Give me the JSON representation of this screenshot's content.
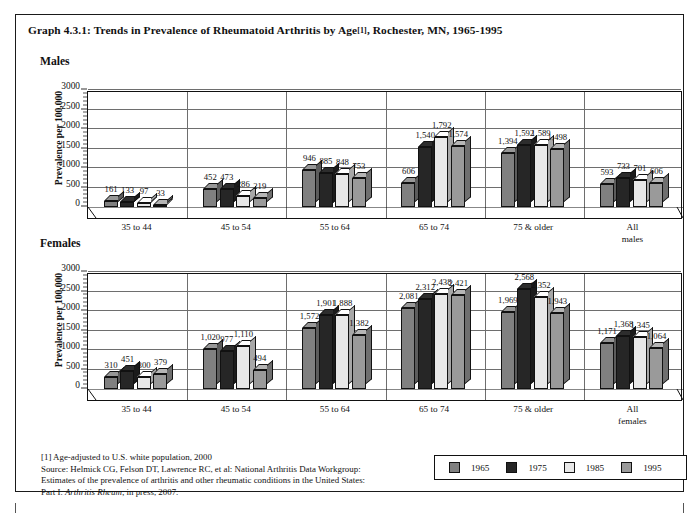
{
  "title": {
    "text_before": "Graph 4.3.1: Trends in Prevalence of Rheumatoid Arthritis by Age",
    "footnote_marker": "[1]",
    "text_after": ", Rochester, MN, 1965-1995"
  },
  "panels": {
    "males_label": "Males",
    "females_label": "Females"
  },
  "axis": {
    "ylabel": "Prevalence per 100,000",
    "yticks": [
      "0",
      "500",
      "1000",
      "1500",
      "2000",
      "2500",
      "3000"
    ]
  },
  "legend": {
    "items": [
      {
        "label": "1965",
        "color": "#808080"
      },
      {
        "label": "1975",
        "color": "#262626"
      },
      {
        "label": "1985",
        "color": "#e8e8e8"
      },
      {
        "label": "1995",
        "color": "#9a9a9a"
      }
    ]
  },
  "footnote": {
    "line1": "[1] Age-adjusted to U.S. white population, 2000",
    "line2": "Source: Helmick CG, Felson DT, Lawrence RC, et al: National Arthritis Data Workgroup:",
    "line3": "Estimates of the prevalence of arthritis and other rheumatic conditions in the United States:",
    "line4_a": "Part I. ",
    "line4_italic": "Arthritis Rheum",
    "line4_b": "; in press, 2007."
  },
  "chart_data": [
    {
      "type": "bar",
      "title": "Males",
      "xlabel": "",
      "ylabel": "Prevalence per 100,000",
      "ylim": [
        0,
        3000
      ],
      "ytick_step": 500,
      "grid": true,
      "legend_position": "bottom-right",
      "categories": [
        "35 to 44",
        "45 to 54",
        "55 to 64",
        "65 to 74",
        "75 & older",
        "All\nmales"
      ],
      "series": [
        {
          "name": "1965",
          "color": "#808080",
          "values": [
            161,
            452,
            946,
            606,
            1394,
            593
          ],
          "labels": [
            "161",
            "452",
            "946",
            "606",
            "1,394",
            "593"
          ]
        },
        {
          "name": "1975",
          "color": "#262626",
          "values": [
            133,
            473,
            885,
            1540,
            1592,
            733
          ],
          "labels": [
            "133",
            "473",
            "885",
            "1,540",
            "1,592",
            "733"
          ]
        },
        {
          "name": "1985",
          "color": "#e8e8e8",
          "values": [
            97,
            286,
            848,
            1792,
            1589,
            701
          ],
          "labels": [
            "97",
            "286",
            "848",
            "1,792",
            "1,589",
            "701"
          ]
        },
        {
          "name": "1995",
          "color": "#9a9a9a",
          "values": [
            33,
            219,
            753,
            1574,
            1498,
            606
          ],
          "labels": [
            "33",
            "219",
            "753",
            "1,574",
            "1,498",
            "606"
          ]
        }
      ]
    },
    {
      "type": "bar",
      "title": "Females",
      "xlabel": "",
      "ylabel": "Prevalence per 100,000",
      "ylim": [
        0,
        3000
      ],
      "ytick_step": 500,
      "grid": true,
      "legend_position": "bottom-right",
      "categories": [
        "35 to 44",
        "45 to 54",
        "55 to 64",
        "65 to 74",
        "75 & older",
        "All\nfemales"
      ],
      "series": [
        {
          "name": "1965",
          "color": "#808080",
          "values": [
            310,
            1020,
            1572,
            2081,
            1969,
            1171
          ],
          "labels": [
            "310",
            "1,020",
            "1,572",
            "2,081",
            "1,969",
            "1,171"
          ]
        },
        {
          "name": "1975",
          "color": "#262626",
          "values": [
            451,
            977,
            1901,
            2312,
            2568,
            1368
          ],
          "labels": [
            "451",
            "977",
            "1,901",
            "2,312",
            "2,568",
            "1,368"
          ]
        },
        {
          "name": "1985",
          "color": "#e8e8e8",
          "values": [
            300,
            1110,
            1888,
            2438,
            2352,
            1345
          ],
          "labels": [
            "300",
            "1,110",
            "1,888",
            "2,438",
            "2,352",
            "1,345"
          ]
        },
        {
          "name": "1995",
          "color": "#9a9a9a",
          "values": [
            379,
            494,
            1382,
            2421,
            1943,
            1064
          ],
          "labels": [
            "379",
            "494",
            "1,382",
            "2,421",
            "1,943",
            "1,064"
          ]
        }
      ]
    }
  ],
  "male_category_labels": [
    {
      "l1": "35 to 44",
      "l2": ""
    },
    {
      "l1": "45 to 54",
      "l2": ""
    },
    {
      "l1": "55 to 64",
      "l2": ""
    },
    {
      "l1": "65 to 74",
      "l2": ""
    },
    {
      "l1": "75 & older",
      "l2": ""
    },
    {
      "l1": "All",
      "l2": "males"
    }
  ],
  "female_category_labels": [
    {
      "l1": "35 to 44",
      "l2": ""
    },
    {
      "l1": "45 to 54",
      "l2": ""
    },
    {
      "l1": "55 to 64",
      "l2": ""
    },
    {
      "l1": "65 to 74",
      "l2": ""
    },
    {
      "l1": "75 & older",
      "l2": ""
    },
    {
      "l1": "All",
      "l2": "females"
    }
  ]
}
